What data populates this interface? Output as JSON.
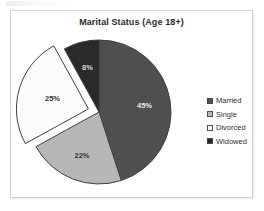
{
  "chart_data": {
    "type": "pie",
    "title": "Marital Status (Age 18+)",
    "xlabel": "",
    "ylabel": "",
    "grid": false,
    "legend_position": "right",
    "categories": [
      "Married",
      "Single",
      "Divorced",
      "Widowed"
    ],
    "values": [
      45,
      22,
      25,
      8
    ],
    "value_suffix": "%",
    "data_labels": [
      "45%",
      "22%",
      "25%",
      "8%"
    ],
    "slices": [
      {
        "label": "Married",
        "value": 45,
        "data_label": "45%",
        "color": "#4f4f4f",
        "label_color": "#ececec",
        "exploded": false
      },
      {
        "label": "Single",
        "value": 22,
        "data_label": "22%",
        "color": "#b7b7b7",
        "label_color": "#333333",
        "exploded": false
      },
      {
        "label": "Divorced",
        "value": 25,
        "data_label": "25%",
        "color": "#fbfbfb",
        "label_color": "#333333",
        "exploded": true
      },
      {
        "label": "Widowed",
        "value": 8,
        "data_label": "8%",
        "color": "#2a2a2a",
        "label_color": "#d8d8d8",
        "exploded": false
      }
    ]
  },
  "chart": {
    "title": "Marital Status (Age 18+)",
    "frame_color": "#d3d3d3",
    "background": "#ffffff",
    "slice_outline": "#3f3f3f"
  },
  "legend": {
    "items": [
      {
        "label": "Married",
        "color": "#4f4f4f"
      },
      {
        "label": "Single",
        "color": "#b7b7b7"
      },
      {
        "label": "Divorced",
        "color": "#fbfbfb"
      },
      {
        "label": "Widowed",
        "color": "#2a2a2a"
      }
    ]
  }
}
